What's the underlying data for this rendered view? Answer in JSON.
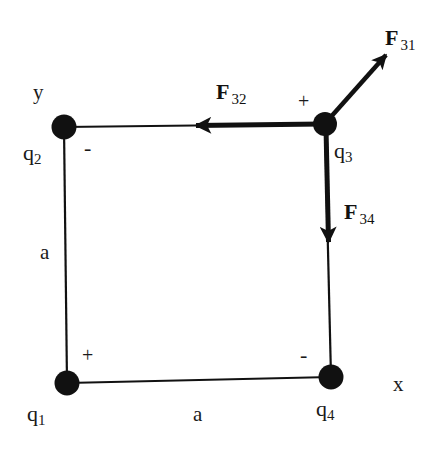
{
  "diagram": {
    "type": "coulomb-forces-square-charges",
    "axes": {
      "x_label": "x",
      "y_label": "y"
    },
    "side_labels": {
      "left": "a",
      "bottom": "a"
    },
    "charges": [
      {
        "id": "q1",
        "name": "q",
        "sub": "1",
        "sign": "+",
        "position": "bottom-left (origin)"
      },
      {
        "id": "q2",
        "name": "q",
        "sub": "2",
        "sign": "-",
        "position": "top-left"
      },
      {
        "id": "q3",
        "name": "q",
        "sub": "3",
        "sign": "+",
        "position": "top-right"
      },
      {
        "id": "q4",
        "name": "q",
        "sub": "4",
        "sign": "-",
        "position": "bottom-right"
      }
    ],
    "forces": [
      {
        "id": "F31",
        "name": "F",
        "sub": "31",
        "on": "q3",
        "direction": "away from q1 (up-right, diagonal)"
      },
      {
        "id": "F32",
        "name": "F",
        "sub": "32",
        "on": "q3",
        "direction": "toward q2 (left)"
      },
      {
        "id": "F34",
        "name": "F",
        "sub": "34",
        "on": "q3",
        "direction": "toward q4 (down)"
      }
    ],
    "colors": {
      "ink": "#111111",
      "background": "#ffffff"
    }
  }
}
